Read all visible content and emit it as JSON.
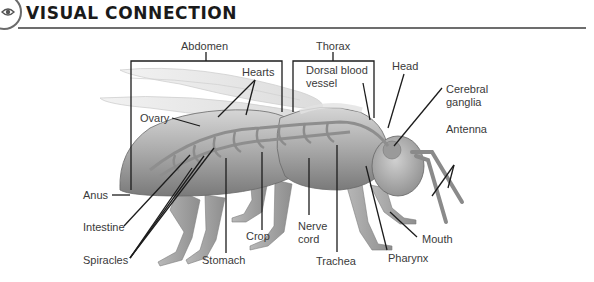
{
  "header": {
    "icon": "eye-icon",
    "title": "VISUAL CONNECTION"
  },
  "figure": {
    "labels": {
      "abdomen": "Abdomen",
      "thorax": "Thorax",
      "hearts": "Hearts",
      "ovary": "Ovary",
      "dorsal_blood_vessel_line1": "Dorsal blood",
      "dorsal_blood_vessel_line2": "vessel",
      "head": "Head",
      "cerebral_ganglia_line1": "Cerebral",
      "cerebral_ganglia_line2": "ganglia",
      "antenna": "Antenna",
      "anus": "Anus",
      "intestine": "Intestine",
      "spiracles": "Spiracles",
      "stomach": "Stomach",
      "crop": "Crop",
      "nerve_cord_line1": "Nerve",
      "nerve_cord_line2": "cord",
      "trachea": "Trachea",
      "pharynx": "Pharynx",
      "mouth": "Mouth"
    }
  }
}
